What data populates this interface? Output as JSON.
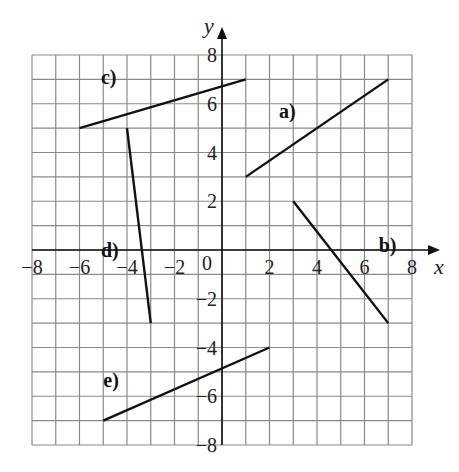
{
  "axes": {
    "x_label": "x",
    "y_label": "y",
    "x_range": [
      -8,
      8
    ],
    "y_range": [
      -8,
      8
    ],
    "origin_label": "0",
    "x_ticks": [
      "−8",
      "−6",
      "−4",
      "−2",
      "2",
      "4",
      "6",
      "8"
    ],
    "y_ticks": [
      "8",
      "6",
      "4",
      "2",
      "−2",
      "−4",
      "−6",
      "−8"
    ]
  },
  "segments": [
    {
      "label": "a)",
      "from": [
        1,
        3
      ],
      "to": [
        7,
        7
      ]
    },
    {
      "label": "b)",
      "from": [
        3,
        2
      ],
      "to": [
        7,
        -3
      ]
    },
    {
      "label": "c)",
      "from": [
        -6,
        5
      ],
      "to": [
        1,
        7
      ]
    },
    {
      "label": "d)",
      "from": [
        -4,
        5
      ],
      "to": [
        -3,
        -3
      ]
    },
    {
      "label": "e)",
      "from": [
        -5,
        -7
      ],
      "to": [
        2,
        -4
      ]
    }
  ],
  "colors": {
    "grid": "#8a8a8a",
    "line": "#111111",
    "background": "#ffffff"
  }
}
